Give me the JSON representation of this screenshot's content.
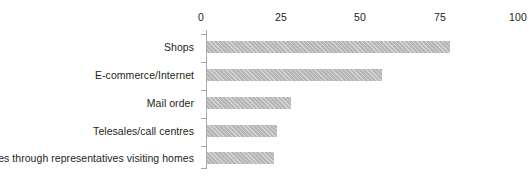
{
  "chart_data": {
    "type": "bar",
    "orientation": "horizontal",
    "title": "",
    "xlabel": "",
    "ylabel": "",
    "xlim": [
      0,
      100
    ],
    "grid": false,
    "legend": null,
    "xticks": [
      "0",
      "25",
      "50",
      "75",
      "100"
    ],
    "xtick_values": [
      0,
      25,
      50,
      75,
      100
    ],
    "categories": [
      "Shops",
      "E-commerce/Internet",
      "Mail order",
      "Telesales/call centres",
      "Sales through representatives visiting homes"
    ],
    "values": [
      78,
      56,
      27,
      22.5,
      21.5
    ],
    "bar_color": "#b6b7b9",
    "bar_pattern": "diagonal-hatch",
    "axis_color": "#a7a9ac",
    "text_color": "#231f20",
    "background": "#ffffff"
  }
}
